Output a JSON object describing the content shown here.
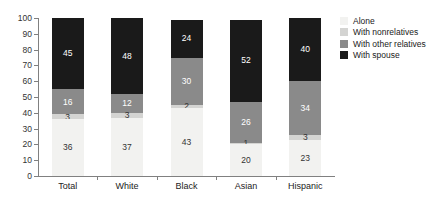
{
  "chart_data": {
    "type": "bar",
    "subtype": "stacked-bar-100",
    "title": "",
    "subtitle": "",
    "xlabel": "",
    "ylabel": "",
    "ylim": [
      0,
      100
    ],
    "yticks": [
      0,
      10,
      20,
      30,
      40,
      50,
      60,
      70,
      80,
      90,
      100
    ],
    "ytick_labels": [
      "0",
      "10",
      "20",
      "30",
      "40",
      "50",
      "60",
      "70",
      "80",
      "90",
      "100"
    ],
    "grid": false,
    "legend_position": "right",
    "categories": [
      "Total",
      "White",
      "Black",
      "Asian",
      "Hispanic"
    ],
    "series": [
      {
        "name": "Alone",
        "color": "#f2f2f0",
        "label_color": "#333333",
        "values": [
          36,
          37,
          43,
          20,
          23
        ]
      },
      {
        "name": "With nonrelatives",
        "color": "#d4d4d2",
        "label_color": "#333333",
        "values": [
          3,
          3,
          2,
          1,
          3
        ]
      },
      {
        "name": "With other relatives",
        "color": "#8a8a8a",
        "label_color": "#ffffff",
        "values": [
          16,
          12,
          30,
          26,
          34
        ]
      },
      {
        "name": "With spouse",
        "color": "#1a1a1a",
        "label_color": "#ffffff",
        "values": [
          45,
          48,
          24,
          52,
          40
        ]
      }
    ]
  },
  "legend": {
    "items": [
      {
        "label": "Alone",
        "color": "#f2f2f0"
      },
      {
        "label": "With nonrelatives",
        "color": "#d4d4d2"
      },
      {
        "label": "With other relatives",
        "color": "#8a8a8a"
      },
      {
        "label": "With spouse",
        "color": "#1a1a1a"
      }
    ]
  },
  "axis": {
    "line_color": "#808080",
    "tick_label_color": "#333333"
  }
}
